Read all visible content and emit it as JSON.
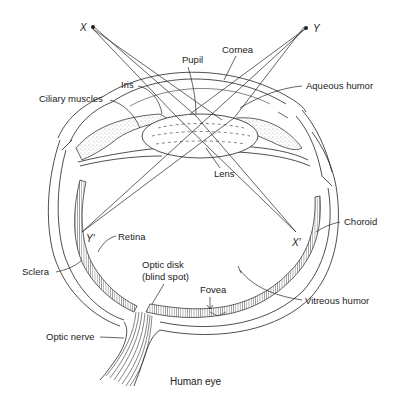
{
  "diagram": {
    "title": "Human eye",
    "points": {
      "x": "X",
      "y": "Y",
      "x_prime": "X′",
      "y_prime": "Y′"
    },
    "labels": {
      "pupil": "Pupil",
      "cornea": "Cornea",
      "iris": "Iris",
      "ciliary_muscles": "Ciliary muscles",
      "aqueous_humor": "Aqueous humor",
      "lens": "Lens",
      "retina": "Retina",
      "choroid": "Choroid",
      "sclera": "Sclera",
      "optic_disk_line1": "Optic disk",
      "optic_disk_line2": "(blind spot)",
      "fovea": "Fovea",
      "vitreous_humor": "Vitreous humor",
      "optic_nerve": "Optic nerve"
    },
    "colors": {
      "ink": "#222222",
      "background": "#ffffff"
    }
  }
}
